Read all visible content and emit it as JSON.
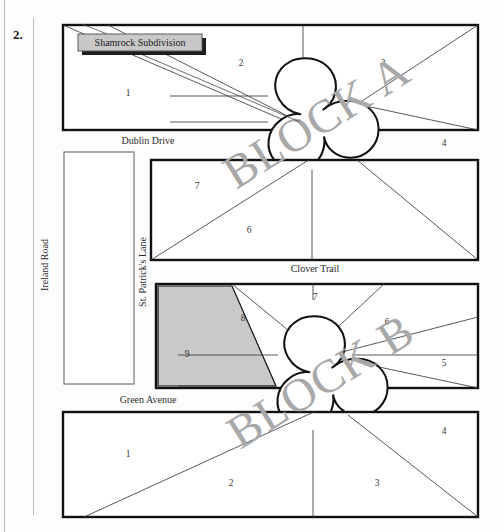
{
  "page": {
    "question_number": "2.",
    "callout_label": "Shamrock Subdivision",
    "accent_gray": "#a8a8a8",
    "shade_gray": "#c9c9c9",
    "callout_fill": "#c8c8c8",
    "ink": "#111111"
  },
  "streets": {
    "ireland_road": "Ireland Road",
    "dublin_drive": "Dublin Drive",
    "st_patricks_lane": "St. Patrick's Lane",
    "clover_trail": "Clover Trail",
    "green_avenue": "Green Avenue"
  },
  "watermarks": [
    {
      "text": "BLOCK A"
    },
    {
      "text": "BLOCK B"
    }
  ],
  "blocks": [
    {
      "name": "block-a-north",
      "lots": [
        "1",
        "2",
        "3",
        "4",
        "5"
      ]
    },
    {
      "name": "block-a-south",
      "lots": [
        "7",
        "6"
      ]
    },
    {
      "name": "block-b-north",
      "lots": [
        "9",
        "8",
        "7",
        "6",
        "5",
        "4"
      ],
      "shaded_lot": "9"
    },
    {
      "name": "block-b-south",
      "lots": [
        "1",
        "2",
        "3",
        "4"
      ]
    }
  ],
  "lot_labels": {
    "a_north_1": "1",
    "a_north_2": "2",
    "a_north_3": "3",
    "a_north_4": "4",
    "a_north_5": "5",
    "a_south_7": "7",
    "a_south_6": "6",
    "b_north_9": "9",
    "b_north_8": "8",
    "b_north_7": "7",
    "b_north_6": "6",
    "b_north_5": "5",
    "b_north_4": "4",
    "b_south_1": "1",
    "b_south_2": "2",
    "b_south_3": "3",
    "b_south_4": "4"
  }
}
